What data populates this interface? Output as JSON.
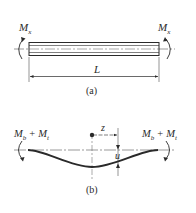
{
  "figure": {
    "part_a": {
      "caption": "(a)",
      "left_moment": {
        "symbol": "M",
        "subscript": "x"
      },
      "right_moment": {
        "symbol": "M",
        "subscript": "x"
      },
      "length_label": "L"
    },
    "part_b": {
      "caption": "(b)",
      "left_moment": {
        "symbol": "M",
        "sub1": "b",
        "plus": "+",
        "symbol2": "M",
        "sub2": "t"
      },
      "right_moment": {
        "symbol": "M",
        "sub1": "b",
        "plus": "+",
        "symbol2": "M",
        "sub2": "t"
      },
      "coordinate_label": "z",
      "deflection_label": "u"
    },
    "colors": {
      "line": "#2a2a2a",
      "beam_fill": "#ffffff",
      "dashed": "#555555"
    }
  }
}
